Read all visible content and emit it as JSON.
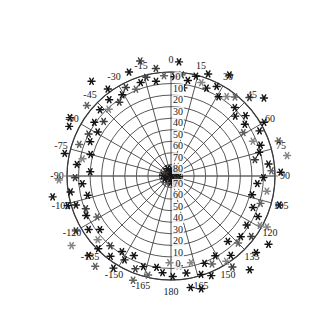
{
  "figure": {
    "kind": "polar-skyplot",
    "background_color": "#ffffff",
    "grid_color": "#3a3a3a",
    "axis_color": "#6a6a6a",
    "text_color": "#1a1a1a"
  },
  "chart_data": {
    "type": "scatter",
    "projection": "polar",
    "title": "",
    "subtitle": "",
    "xlabel": "",
    "ylabel": "",
    "grid": true,
    "legend": null,
    "center": {
      "x": 171,
      "y": 176
    },
    "outer_radius_px": 104,
    "angular_axis": {
      "label": "",
      "unit": "degrees",
      "range": [
        -180,
        180
      ],
      "tick_step": 15,
      "zero_at": "top",
      "direction": "clockwise",
      "tick_labels": [
        "0",
        "15",
        "30",
        "45",
        "60",
        "75",
        "90",
        "105",
        "120",
        "135",
        "150",
        "165",
        "180",
        "-165",
        "-150",
        "-135",
        "-120",
        "-105",
        "-90",
        "-75",
        "-60",
        "-45",
        "-30",
        "-15"
      ]
    },
    "radial_axis": {
      "label": "",
      "unit": "degrees",
      "range": [
        0,
        90
      ],
      "tick_step": 10,
      "outer_value": 0,
      "center_value": 90,
      "tick_labels_top": [
        "0",
        "10",
        "20",
        "30",
        "40",
        "50",
        "60",
        "70",
        "80"
      ],
      "tick_labels_bottom": [
        "70",
        "60",
        "50",
        "40",
        "30",
        "20",
        "10",
        "0"
      ]
    },
    "marker": {
      "shape": "asterisk",
      "size_px": 7,
      "colors": [
        "#141414",
        "#3c3c3c",
        "#606060",
        "#858585",
        "#a8a8a8"
      ]
    },
    "series": [
      {
        "name": "observations",
        "points": [
          {
            "az": 0,
            "el": 88,
            "c": 0
          },
          {
            "az": 12,
            "el": 87,
            "c": 0
          },
          {
            "az": 25,
            "el": 88,
            "c": 1
          },
          {
            "az": 40,
            "el": 86,
            "c": 0
          },
          {
            "az": 55,
            "el": 87,
            "c": 1
          },
          {
            "az": 70,
            "el": 88,
            "c": 0
          },
          {
            "az": 85,
            "el": 86,
            "c": 2
          },
          {
            "az": 100,
            "el": 87,
            "c": 0
          },
          {
            "az": 115,
            "el": 88,
            "c": 1
          },
          {
            "az": 130,
            "el": 86,
            "c": 0
          },
          {
            "az": 145,
            "el": 87,
            "c": 0
          },
          {
            "az": 160,
            "el": 88,
            "c": 1
          },
          {
            "az": 175,
            "el": 86,
            "c": 0
          },
          {
            "az": -170,
            "el": 87,
            "c": 2
          },
          {
            "az": -155,
            "el": 88,
            "c": 0
          },
          {
            "az": -140,
            "el": 86,
            "c": 0
          },
          {
            "az": -125,
            "el": 87,
            "c": 1
          },
          {
            "az": -110,
            "el": 88,
            "c": 0
          },
          {
            "az": -95,
            "el": 86,
            "c": 0
          },
          {
            "az": -80,
            "el": 87,
            "c": 1
          },
          {
            "az": -65,
            "el": 88,
            "c": 0
          },
          {
            "az": -50,
            "el": 86,
            "c": 2
          },
          {
            "az": -35,
            "el": 87,
            "c": 0
          },
          {
            "az": -20,
            "el": 88,
            "c": 0
          },
          {
            "az": 5,
            "el": 84,
            "c": 0
          },
          {
            "az": 35,
            "el": 83,
            "c": 1
          },
          {
            "az": 65,
            "el": 84,
            "c": 0
          },
          {
            "az": 95,
            "el": 83,
            "c": 0
          },
          {
            "az": 125,
            "el": 84,
            "c": 1
          },
          {
            "az": 155,
            "el": 83,
            "c": 0
          },
          {
            "az": -175,
            "el": 84,
            "c": 0
          },
          {
            "az": -145,
            "el": 83,
            "c": 2
          },
          {
            "az": -115,
            "el": 84,
            "c": 0
          },
          {
            "az": -85,
            "el": 83,
            "c": 0
          },
          {
            "az": -55,
            "el": 84,
            "c": 1
          },
          {
            "az": -25,
            "el": 83,
            "c": 0
          },
          {
            "az": 2,
            "el": 4,
            "c": 0
          },
          {
            "az": 6,
            "el": 2,
            "c": 1
          },
          {
            "az": 10,
            "el": 6,
            "c": 0
          },
          {
            "az": -4,
            "el": 3,
            "c": 2
          },
          {
            "az": -9,
            "el": 7,
            "c": 0
          },
          {
            "az": -14,
            "el": 2,
            "c": 1
          },
          {
            "az": 14,
            "el": 1,
            "c": 0
          },
          {
            "az": 18,
            "el": 5,
            "c": 3
          },
          {
            "az": 22,
            "el": 8,
            "c": 0
          },
          {
            "az": -18,
            "el": 5,
            "c": 0
          },
          {
            "az": -22,
            "el": 9,
            "c": 2
          },
          {
            "az": -27,
            "el": 4,
            "c": 1
          },
          {
            "az": 27,
            "el": 3,
            "c": 0
          },
          {
            "az": 31,
            "el": 10,
            "c": 0
          },
          {
            "az": 35,
            "el": 6,
            "c": 3
          },
          {
            "az": -31,
            "el": 8,
            "c": 0
          },
          {
            "az": -35,
            "el": 12,
            "c": 1
          },
          {
            "az": -39,
            "el": 5,
            "c": 0
          },
          {
            "az": 39,
            "el": 2,
            "c": 2
          },
          {
            "az": 43,
            "el": 9,
            "c": 0
          },
          {
            "az": 47,
            "el": 14,
            "c": 0
          },
          {
            "az": -43,
            "el": 11,
            "c": 3
          },
          {
            "az": -47,
            "el": 6,
            "c": 0
          },
          {
            "az": -51,
            "el": 15,
            "c": 1
          },
          {
            "az": 51,
            "el": 7,
            "c": 0
          },
          {
            "az": 55,
            "el": 12,
            "c": 0
          },
          {
            "az": 59,
            "el": 17,
            "c": 2
          },
          {
            "az": -55,
            "el": 9,
            "c": 0
          },
          {
            "az": -59,
            "el": 16,
            "c": 0
          },
          {
            "az": -63,
            "el": 10,
            "c": 1
          },
          {
            "az": 63,
            "el": 4,
            "c": 0
          },
          {
            "az": 67,
            "el": 13,
            "c": 3
          },
          {
            "az": 71,
            "el": 8,
            "c": 0
          },
          {
            "az": -67,
            "el": 14,
            "c": 0
          },
          {
            "az": -71,
            "el": 6,
            "c": 2
          },
          {
            "az": -75,
            "el": 18,
            "c": 0
          },
          {
            "az": 75,
            "el": 11,
            "c": 0
          },
          {
            "az": 79,
            "el": 16,
            "c": 1
          },
          {
            "az": 83,
            "el": 5,
            "c": 0
          },
          {
            "az": -79,
            "el": 12,
            "c": 3
          },
          {
            "az": -83,
            "el": 8,
            "c": 0
          },
          {
            "az": -87,
            "el": 20,
            "c": 0
          },
          {
            "az": 87,
            "el": 3,
            "c": 2
          },
          {
            "az": 91,
            "el": 10,
            "c": 0
          },
          {
            "az": 95,
            "el": 15,
            "c": 0
          },
          {
            "az": -91,
            "el": 7,
            "c": 1
          },
          {
            "az": -95,
            "el": 13,
            "c": 0
          },
          {
            "az": -99,
            "el": 2,
            "c": 0
          },
          {
            "az": 99,
            "el": 6,
            "c": 3
          },
          {
            "az": 103,
            "el": 18,
            "c": 0
          },
          {
            "az": 107,
            "el": 9,
            "c": 2
          },
          {
            "az": -103,
            "el": 16,
            "c": 0
          },
          {
            "az": -107,
            "el": 4,
            "c": 0
          },
          {
            "az": -111,
            "el": 11,
            "c": 1
          },
          {
            "az": 111,
            "el": 14,
            "c": 0
          },
          {
            "az": 115,
            "el": 7,
            "c": 0
          },
          {
            "az": 119,
            "el": 2,
            "c": 3
          },
          {
            "az": -115,
            "el": 9,
            "c": 0
          },
          {
            "az": -119,
            "el": 17,
            "c": 2
          },
          {
            "az": -123,
            "el": 5,
            "c": 0
          },
          {
            "az": 123,
            "el": 12,
            "c": 0
          },
          {
            "az": 127,
            "el": 3,
            "c": 1
          },
          {
            "az": 131,
            "el": 10,
            "c": 0
          },
          {
            "az": -127,
            "el": 13,
            "c": 0
          },
          {
            "az": -131,
            "el": 6,
            "c": 3
          },
          {
            "az": -135,
            "el": 1,
            "c": 0
          },
          {
            "az": 135,
            "el": 8,
            "c": 2
          },
          {
            "az": 139,
            "el": 15,
            "c": 0
          },
          {
            "az": 143,
            "el": 4,
            "c": 0
          },
          {
            "az": -139,
            "el": 10,
            "c": 1
          },
          {
            "az": -143,
            "el": 3,
            "c": 0
          },
          {
            "az": -147,
            "el": 12,
            "c": 0
          },
          {
            "az": 147,
            "el": 2,
            "c": 3
          },
          {
            "az": 151,
            "el": 11,
            "c": 0
          },
          {
            "az": 155,
            "el": 6,
            "c": 2
          },
          {
            "az": -151,
            "el": 7,
            "c": 0
          },
          {
            "az": -155,
            "el": 14,
            "c": 0
          },
          {
            "az": -159,
            "el": 4,
            "c": 1
          },
          {
            "az": 159,
            "el": 9,
            "c": 0
          },
          {
            "az": 163,
            "el": 1,
            "c": 0
          },
          {
            "az": 167,
            "el": 13,
            "c": 3
          },
          {
            "az": -163,
            "el": 8,
            "c": 0
          },
          {
            "az": -167,
            "el": 2,
            "c": 2
          },
          {
            "az": -171,
            "el": 10,
            "c": 0
          },
          {
            "az": 171,
            "el": 5,
            "c": 0
          },
          {
            "az": 175,
            "el": 12,
            "c": 1
          },
          {
            "az": 179,
            "el": 3,
            "c": 0
          },
          {
            "az": -175,
            "el": 6,
            "c": 0
          },
          {
            "az": -179,
            "el": 15,
            "c": 3
          },
          {
            "az": 8,
            "el": 13,
            "c": 0
          },
          {
            "az": 20,
            "el": -4,
            "c": 0
          },
          {
            "az": 45,
            "el": -6,
            "c": 1
          },
          {
            "az": 60,
            "el": -3,
            "c": 0
          },
          {
            "az": 72,
            "el": -8,
            "c": 2
          },
          {
            "az": 88,
            "el": -5,
            "c": 0
          },
          {
            "az": 105,
            "el": -7,
            "c": 0
          },
          {
            "az": 118,
            "el": -4,
            "c": 3
          },
          {
            "az": 132,
            "el": -9,
            "c": 0
          },
          {
            "az": 146,
            "el": -5,
            "c": 1
          },
          {
            "az": 158,
            "el": -3,
            "c": 0
          },
          {
            "az": 170,
            "el": -8,
            "c": 0
          },
          {
            "az": -160,
            "el": -6,
            "c": 2
          },
          {
            "az": -148,
            "el": -4,
            "c": 0
          },
          {
            "az": -134,
            "el": -9,
            "c": 0
          },
          {
            "az": -120,
            "el": -5,
            "c": 1
          },
          {
            "az": -106,
            "el": -3,
            "c": 0
          },
          {
            "az": -92,
            "el": -7,
            "c": 3
          },
          {
            "az": -78,
            "el": -4,
            "c": 0
          },
          {
            "az": -64,
            "el": -8,
            "c": 0
          },
          {
            "az": -50,
            "el": -5,
            "c": 2
          },
          {
            "az": -36,
            "el": -3,
            "c": 0
          },
          {
            "az": -22,
            "el": -7,
            "c": 0
          },
          {
            "az": -8,
            "el": -4,
            "c": 1
          },
          {
            "az": 4,
            "el": -9,
            "c": 0
          },
          {
            "az": 30,
            "el": -11,
            "c": 0
          },
          {
            "az": 80,
            "el": -12,
            "c": 3
          },
          {
            "az": 125,
            "el": -13,
            "c": 0
          },
          {
            "az": 165,
            "el": -11,
            "c": 0
          },
          {
            "az": -140,
            "el": -12,
            "c": 2
          },
          {
            "az": -100,
            "el": -14,
            "c": 0
          },
          {
            "az": -60,
            "el": -11,
            "c": 0
          },
          {
            "az": -15,
            "el": -13,
            "c": 1
          },
          {
            "az": 50,
            "el": -15,
            "c": 0
          },
          {
            "az": 140,
            "el": -16,
            "c": 0
          },
          {
            "az": -125,
            "el": -15,
            "c": 3
          },
          {
            "az": -40,
            "el": -17,
            "c": 0
          }
        ]
      }
    ]
  }
}
